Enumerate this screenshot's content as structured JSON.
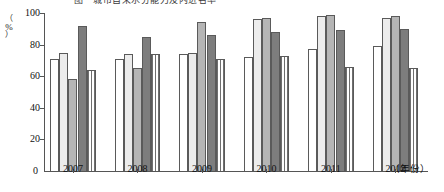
{
  "chart_data": {
    "type": "bar",
    "title": "图　城市自来水分能力及内进名率",
    "xlabel": "（年份）",
    "ylabel": "（%）",
    "ylim": [
      0,
      100
    ],
    "ytick_labels": [
      "100",
      "80",
      "60",
      "40",
      "20",
      "0"
    ],
    "ytick_values": [
      100,
      80,
      60,
      40,
      20,
      0
    ],
    "grid": false,
    "legend_position": "none",
    "categories": [
      "2007",
      "2008",
      "2009",
      "2010",
      "2011",
      "2012"
    ],
    "series": [
      {
        "name": "series-1",
        "values": [
          71,
          71,
          74,
          72,
          77,
          79
        ]
      },
      {
        "name": "series-2",
        "values": [
          75,
          74,
          75,
          96,
          98,
          97
        ]
      },
      {
        "name": "series-3",
        "values": [
          58,
          65,
          94,
          97,
          99,
          98
        ]
      },
      {
        "name": "series-4",
        "values": [
          92,
          85,
          86,
          88,
          89,
          90
        ]
      },
      {
        "name": "series-5",
        "values": [
          64,
          74,
          71,
          73,
          66,
          65
        ]
      }
    ]
  },
  "axes": {
    "y_unit_paren_open": "（",
    "y_unit_symbol": "%",
    "y_unit_paren_close": "）",
    "zero_label": "0",
    "x_unit": "（年份）"
  }
}
